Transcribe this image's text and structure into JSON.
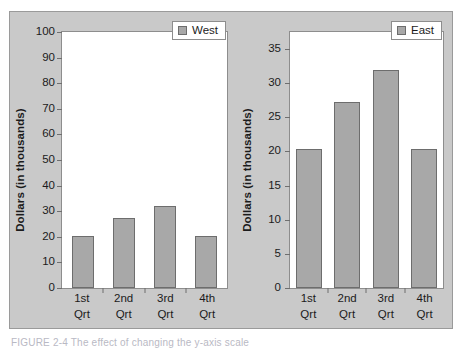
{
  "figure": {
    "caption": "FIGURE 2-4  The effect of changing the y-axis scale"
  },
  "chart_data": [
    {
      "type": "bar",
      "title": "",
      "xlabel": "",
      "ylabel": "Dollars (in thousands)",
      "categories": [
        "1st\nQrt",
        "2nd\nQrt",
        "3rd\nQrt",
        "4th\nQrt"
      ],
      "category_lines": [
        [
          "1st",
          "Qrt"
        ],
        [
          "2nd",
          "Qrt"
        ],
        [
          "3rd",
          "Qrt"
        ],
        [
          "4th",
          "Qrt"
        ]
      ],
      "values": [
        20.4,
        27.2,
        32.0,
        20.3
      ],
      "series": [
        {
          "name": "West",
          "values": [
            20.4,
            27.2,
            32.0,
            20.3
          ]
        }
      ],
      "legend": [
        "West"
      ],
      "legend_position": "top-right",
      "ylim": [
        0,
        100
      ],
      "yticks": [
        0,
        10,
        20,
        30,
        40,
        50,
        60,
        70,
        80,
        90,
        100
      ],
      "ytick_labels": [
        "0",
        "10",
        "20",
        "30",
        "40",
        "50",
        "60",
        "70",
        "80",
        "90",
        "100"
      ],
      "grid": false,
      "bar_color": "#a8a8a8",
      "bar_edge_color": "#6d6d6d"
    },
    {
      "type": "bar",
      "title": "",
      "xlabel": "",
      "ylabel": "Dollars (in thousands)",
      "categories": [
        "1st\nQrt",
        "2nd\nQrt",
        "3rd\nQrt",
        "4th\nQrt"
      ],
      "category_lines": [
        [
          "1st",
          "Qrt"
        ],
        [
          "2nd",
          "Qrt"
        ],
        [
          "3rd",
          "Qrt"
        ],
        [
          "4th",
          "Qrt"
        ]
      ],
      "values": [
        20.4,
        27.2,
        32.0,
        20.3
      ],
      "series": [
        {
          "name": "East",
          "values": [
            20.4,
            27.2,
            32.0,
            20.3
          ]
        }
      ],
      "legend": [
        "East"
      ],
      "legend_position": "top-right",
      "ylim": [
        0,
        37.5
      ],
      "yticks": [
        0,
        5,
        10,
        15,
        20,
        25,
        30,
        35
      ],
      "ytick_labels": [
        "0",
        "5",
        "10",
        "15",
        "20",
        "25",
        "30",
        "35"
      ],
      "grid": false,
      "bar_color": "#a8a8a8",
      "bar_edge_color": "#6d6d6d"
    }
  ],
  "colors": {
    "panel_background": "#c9c9c9",
    "plot_background": "#ffffff",
    "axis": "#8d8d8d",
    "text": "#1b1b1b"
  }
}
